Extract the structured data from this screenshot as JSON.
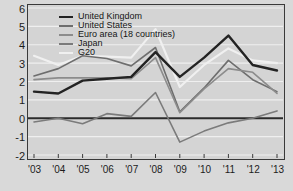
{
  "chart_data": {
    "type": "line",
    "title": "",
    "subtitle": "",
    "xlabel": "",
    "ylabel": "",
    "xlim": [
      2003,
      2013
    ],
    "ylim": [
      -2,
      6
    ],
    "grid": true,
    "grid_orientation": "horizontal",
    "legend_position": "top-left",
    "zero_line": true,
    "x": [
      2003,
      2004,
      2005,
      2006,
      2007,
      2008,
      2009,
      2010,
      2011,
      2012,
      2013
    ],
    "xtick_labels": [
      "'03",
      "'04",
      "'05",
      "'06",
      "'07",
      "'08",
      "'09",
      "'10",
      "'11",
      "'12",
      "'13"
    ],
    "ytick_labels": [
      "6",
      "5",
      "4",
      "3",
      "2",
      "1",
      "0",
      "-1",
      "-2"
    ],
    "ytick_values": [
      6,
      5,
      4,
      3,
      2,
      1,
      0,
      -1,
      -2
    ],
    "series": [
      {
        "name": "United Kingdom",
        "color": "#232323",
        "width": 2.4,
        "values": [
          1.45,
          1.35,
          2.05,
          2.15,
          2.25,
          3.6,
          2.25,
          3.3,
          4.5,
          2.9,
          2.6
        ]
      },
      {
        "name": "United States",
        "color": "#6e6e6e",
        "width": 1.6,
        "values": [
          2.3,
          2.7,
          3.4,
          3.25,
          2.85,
          3.85,
          0.35,
          1.65,
          3.15,
          2.1,
          1.45
        ]
      },
      {
        "name": "Euro area (18 countries)",
        "color": "#8c8c8c",
        "width": 1.6,
        "values": [
          2.1,
          2.2,
          2.2,
          2.2,
          2.15,
          3.3,
          0.3,
          1.6,
          2.7,
          2.5,
          1.35
        ]
      },
      {
        "name": "Japan",
        "color": "#7b7b7b",
        "width": 1.6,
        "values": [
          -0.2,
          0.0,
          -0.3,
          0.25,
          0.1,
          1.4,
          -1.3,
          -0.7,
          -0.25,
          0.0,
          0.4
        ]
      },
      {
        "name": "G20",
        "color": "#f0f0f0",
        "width": 2.2,
        "values": [
          3.4,
          2.9,
          3.4,
          3.35,
          3.3,
          4.85,
          1.7,
          2.9,
          3.8,
          3.15,
          3.0
        ]
      }
    ]
  }
}
